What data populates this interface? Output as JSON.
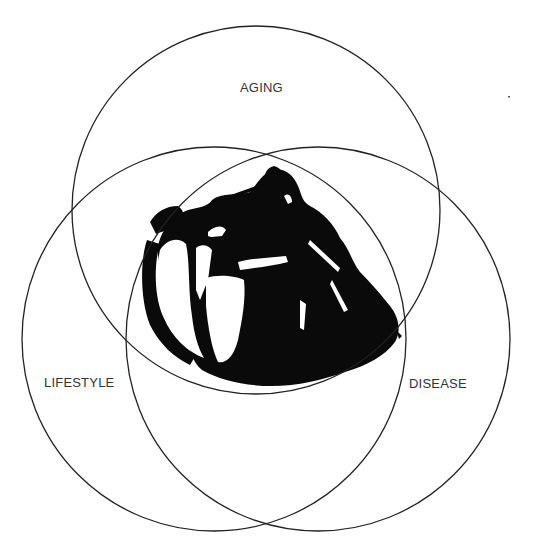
{
  "diagram": {
    "type": "venn-3",
    "circles": [
      {
        "id": "aging",
        "label": "AGING",
        "cx": 256,
        "cy": 210,
        "r": 184
      },
      {
        "id": "lifestyle",
        "label": "LIFESTYLE",
        "cx": 214,
        "cy": 339,
        "r": 192
      },
      {
        "id": "disease",
        "label": "DISEASE",
        "cx": 318,
        "cy": 339,
        "r": 192
      }
    ],
    "center_image": "heart-illustration",
    "stroke_color": "#222222",
    "background": "#ffffff"
  }
}
